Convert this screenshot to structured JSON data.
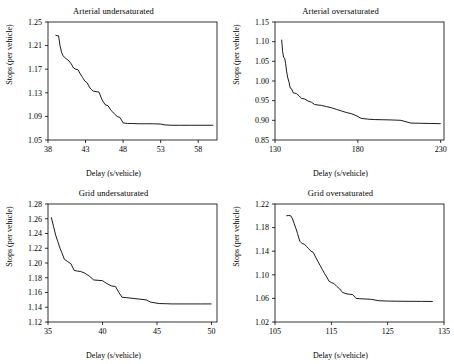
{
  "figure": {
    "background": "#ffffff",
    "line_color": "#000000",
    "axis_color": "#000000"
  },
  "chart_data": [
    {
      "type": "line",
      "title": "Arterial undersaturated",
      "xlabel": "Delay (s/vehicle)",
      "ylabel": "Stops (per vehicle)",
      "xlim": [
        38,
        60.5
      ],
      "ylim": [
        1.05,
        1.25
      ],
      "xticks": [
        38,
        43,
        48,
        53,
        58
      ],
      "yticks": [
        1.05,
        1.09,
        1.13,
        1.17,
        1.21,
        1.25
      ],
      "grid": false,
      "legend": "none",
      "x": [
        39.0,
        39.2,
        39.4,
        39.6,
        39.8,
        40.0,
        40.2,
        40.5,
        40.8,
        41.1,
        41.4,
        41.7,
        42.0,
        42.3,
        42.6,
        42.9,
        43.2,
        43.6,
        44.0,
        44.4,
        44.8,
        45.2,
        45.6,
        46.0,
        46.4,
        46.8,
        47.2,
        47.6,
        48.0,
        48.6,
        49.2,
        50.0,
        51.0,
        52.0,
        53.0,
        53.6,
        54.4,
        55.5,
        57.0,
        58.5,
        60.0
      ],
      "y": [
        1.2275,
        1.227,
        1.2265,
        1.21,
        1.199,
        1.193,
        1.19,
        1.187,
        1.184,
        1.179,
        1.172,
        1.17,
        1.169,
        1.162,
        1.156,
        1.15,
        1.147,
        1.138,
        1.133,
        1.132,
        1.131,
        1.118,
        1.11,
        1.108,
        1.1,
        1.095,
        1.09,
        1.088,
        1.079,
        1.078,
        1.078,
        1.0775,
        1.0775,
        1.0775,
        1.077,
        1.0755,
        1.075,
        1.075,
        1.075,
        1.075,
        1.075
      ]
    },
    {
      "type": "line",
      "title": "Arterial oversaturated",
      "xlabel": "Delay (s/vehicle)",
      "ylabel": "Stops (per vehicle)",
      "xlim": [
        130,
        232
      ],
      "ylim": [
        0.85,
        1.15
      ],
      "xticks": [
        130,
        180,
        230
      ],
      "yticks": [
        0.85,
        0.9,
        0.95,
        1.0,
        1.05,
        1.1,
        1.15
      ],
      "grid": false,
      "legend": "none",
      "x": [
        134.0,
        134.6,
        135.2,
        135.8,
        136.4,
        137.0,
        137.6,
        138.4,
        139.2,
        140.0,
        141.0,
        142.0,
        143.0,
        144.5,
        146.0,
        148.0,
        150.0,
        152.0,
        154.0,
        156.0,
        158.0,
        161.0,
        164.0,
        167.0,
        170.0,
        173.0,
        176.0,
        179.0,
        182.0,
        186.0,
        190.0,
        195.0,
        200.0,
        203.0,
        206.0,
        212.0,
        218.0,
        224.0,
        230.0
      ],
      "y": [
        1.105,
        1.075,
        1.06,
        1.058,
        1.045,
        1.025,
        1.01,
        0.998,
        0.982,
        0.98,
        0.97,
        0.969,
        0.968,
        0.962,
        0.956,
        0.954,
        0.949,
        0.946,
        0.94,
        0.939,
        0.938,
        0.935,
        0.932,
        0.928,
        0.924,
        0.92,
        0.917,
        0.912,
        0.905,
        0.903,
        0.902,
        0.9015,
        0.901,
        0.9005,
        0.9,
        0.893,
        0.8925,
        0.892,
        0.8915
      ]
    },
    {
      "type": "line",
      "title": "Grid undersaturated",
      "xlabel": "Delay (s/vehicle)",
      "ylabel": "Stops (per vehicle)",
      "xlim": [
        35,
        50.5
      ],
      "ylim": [
        1.12,
        1.28
      ],
      "xticks": [
        35,
        40,
        45,
        50
      ],
      "yticks": [
        1.12,
        1.14,
        1.16,
        1.18,
        1.2,
        1.22,
        1.24,
        1.26,
        1.28
      ],
      "grid": false,
      "legend": "none",
      "x": [
        35.3,
        35.5,
        35.7,
        35.9,
        36.1,
        36.3,
        36.5,
        36.8,
        37.1,
        37.4,
        37.7,
        38.0,
        38.4,
        38.8,
        39.2,
        39.6,
        40.0,
        40.4,
        40.8,
        41.2,
        41.5,
        41.8,
        42.2,
        42.8,
        43.4,
        44.0,
        44.4,
        44.8,
        45.2,
        45.8,
        46.4,
        47.2,
        48.0,
        49.0,
        50.0
      ],
      "y": [
        1.262,
        1.25,
        1.238,
        1.229,
        1.22,
        1.213,
        1.205,
        1.202,
        1.199,
        1.19,
        1.189,
        1.1885,
        1.186,
        1.182,
        1.177,
        1.1765,
        1.176,
        1.172,
        1.169,
        1.168,
        1.16,
        1.1535,
        1.153,
        1.152,
        1.151,
        1.15,
        1.147,
        1.146,
        1.145,
        1.1448,
        1.1445,
        1.1445,
        1.1445,
        1.1445,
        1.1445
      ]
    },
    {
      "type": "line",
      "title": "Grid oversaturated",
      "xlabel": "Delay (s/vehicle)",
      "ylabel": "Stops (per vehicle)",
      "xlim": [
        105,
        135
      ],
      "ylim": [
        1.02,
        1.22
      ],
      "xticks": [
        105,
        115,
        125,
        135
      ],
      "yticks": [
        1.02,
        1.06,
        1.1,
        1.14,
        1.18,
        1.22
      ],
      "grid": false,
      "legend": "none",
      "x": [
        107.0,
        107.4,
        107.8,
        108.1,
        108.4,
        108.7,
        109.0,
        109.4,
        109.8,
        110.2,
        110.6,
        111.0,
        111.4,
        111.8,
        112.2,
        112.6,
        113.0,
        113.4,
        113.8,
        114.2,
        114.6,
        115.0,
        115.5,
        116.0,
        116.5,
        117.0,
        117.6,
        118.2,
        118.8,
        119.4,
        120.0,
        121.0,
        122.0,
        123.5,
        125.0,
        127.0,
        129.0,
        131.0,
        133.0
      ],
      "y": [
        1.2,
        1.2005,
        1.2,
        1.195,
        1.187,
        1.179,
        1.17,
        1.157,
        1.153,
        1.152,
        1.148,
        1.144,
        1.14,
        1.138,
        1.13,
        1.123,
        1.116,
        1.109,
        1.102,
        1.096,
        1.089,
        1.087,
        1.085,
        1.08,
        1.076,
        1.07,
        1.068,
        1.067,
        1.0665,
        1.06,
        1.0595,
        1.059,
        1.0585,
        1.056,
        1.0555,
        1.0552,
        1.055,
        1.055,
        1.0548
      ]
    }
  ]
}
